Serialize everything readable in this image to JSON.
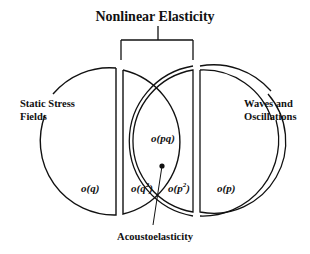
{
  "title": "Nonlinear Elasticity",
  "left_circle": {
    "label_line1": "Static Stress",
    "label_line2": "Fields",
    "term": "o(q)"
  },
  "right_circle": {
    "label_line1": "Waves and",
    "label_line2": "Oscillations",
    "term": "o(p)"
  },
  "middle_left": {
    "term_base": "o(q",
    "term_exp": "2",
    "term_close": ")"
  },
  "middle_right": {
    "term_base": "o(p",
    "term_exp": "2",
    "term_close": ")"
  },
  "overlap": {
    "term": "o(pq)"
  },
  "pointer_label": "Acoustoelasticity",
  "colors": {
    "stroke": "#111111",
    "background": "#ffffff"
  }
}
